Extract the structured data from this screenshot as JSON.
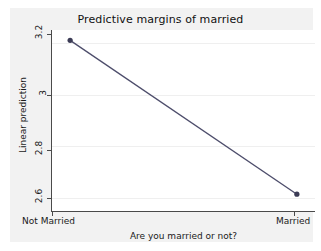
{
  "chart_data": {
    "type": "line",
    "title": "Predictive margins of married",
    "xlabel": "Are you married or not?",
    "ylabel": "Linear prediction",
    "categories": [
      "Not Married",
      "Married"
    ],
    "x": [
      0,
      1
    ],
    "values": [
      3.21,
      2.615
    ],
    "series": [
      {
        "name": "Predictive margins",
        "values": [
          3.21,
          2.615
        ]
      }
    ],
    "ylim": [
      2.55,
      3.25
    ],
    "xlim": [
      -0.08,
      1.08
    ],
    "yticks": [
      3.2,
      3,
      2.8,
      2.6
    ],
    "ytick_labels": [
      "3.2",
      "3",
      "2.8",
      "2.6"
    ],
    "xtick_labels": [
      "Not Married",
      "Married"
    ],
    "grid": true,
    "grid_axis": "y",
    "legend": false,
    "legend_position": "none",
    "marker": "circle",
    "line_color": "#4d4d6b",
    "marker_color": "#3b3b55",
    "plot_background": "#ffffff",
    "figure_background": "#f2f2f2",
    "annotations": []
  },
  "figure": {
    "title": "Predictive margins of married",
    "y_axis": {
      "title": "Linear prediction",
      "ticks": [
        {
          "label": "3.2",
          "value": 3.2
        },
        {
          "label": "3",
          "value": 3
        },
        {
          "label": "2.8",
          "value": 2.8
        },
        {
          "label": "2.6",
          "value": 2.6
        }
      ]
    },
    "x_axis": {
      "title": "Are you married or not?",
      "ticks": [
        {
          "label": "Not Married",
          "value": 0
        },
        {
          "label": "Married",
          "value": 1
        }
      ]
    },
    "points": [
      {
        "category": "Not Married",
        "value": 3.21
      },
      {
        "category": "Married",
        "value": 2.615
      }
    ]
  }
}
